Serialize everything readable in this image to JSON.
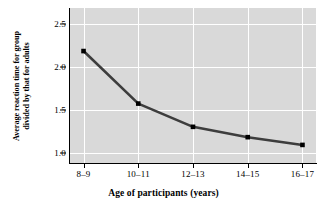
{
  "chart_data": {
    "type": "line",
    "title": "",
    "xlabel": "Age of participants (years)",
    "ylabel_line1": "Average reaction time for group",
    "ylabel_line2": "divided by that for adults",
    "categories": [
      "8–9",
      "10–11",
      "12–13",
      "14–15",
      "16–17"
    ],
    "values": [
      2.18,
      1.57,
      1.3,
      1.18,
      1.09
    ],
    "ylim": [
      0.88,
      2.68
    ],
    "yticks": [
      1.0,
      1.5,
      2.0,
      2.5
    ],
    "ytick_labels": [
      "1.0",
      "1.5",
      "2.0",
      "2.5"
    ],
    "grid": "white gridlines on gray panel",
    "legend": "none",
    "series_color": "#3d3d3d",
    "marker_color": "#000000",
    "panel_color": "#d9d9d9",
    "gridline_color": "#ffffff"
  }
}
